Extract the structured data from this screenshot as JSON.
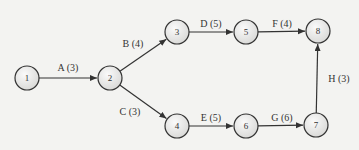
{
  "diagram": {
    "type": "activity-on-arrow network",
    "nodes": [
      {
        "id": "1",
        "x": 27,
        "y": 78
      },
      {
        "id": "2",
        "x": 110,
        "y": 78
      },
      {
        "id": "3",
        "x": 177,
        "y": 32
      },
      {
        "id": "4",
        "x": 177,
        "y": 126
      },
      {
        "id": "5",
        "x": 246,
        "y": 32
      },
      {
        "id": "6",
        "x": 246,
        "y": 126
      },
      {
        "id": "7",
        "x": 316,
        "y": 125
      },
      {
        "id": "8",
        "x": 318,
        "y": 31
      }
    ],
    "edges": [
      {
        "from": "1",
        "to": "2",
        "label": "A (3)",
        "lx": 68,
        "ly": 71
      },
      {
        "from": "2",
        "to": "3",
        "label": "B (4)",
        "lx": 133,
        "ly": 47
      },
      {
        "from": "2",
        "to": "4",
        "label": "C (3)",
        "lx": 130,
        "ly": 115
      },
      {
        "from": "3",
        "to": "5",
        "label": "D (5)",
        "lx": 211,
        "ly": 27
      },
      {
        "from": "5",
        "to": "8",
        "label": "F (4)",
        "lx": 282,
        "ly": 27
      },
      {
        "from": "4",
        "to": "6",
        "label": "E (5)",
        "lx": 211,
        "ly": 121
      },
      {
        "from": "6",
        "to": "7",
        "label": "G (6)",
        "lx": 282,
        "ly": 121
      },
      {
        "from": "7",
        "to": "8",
        "label": "H (3)",
        "lx": 339,
        "ly": 82
      }
    ]
  }
}
